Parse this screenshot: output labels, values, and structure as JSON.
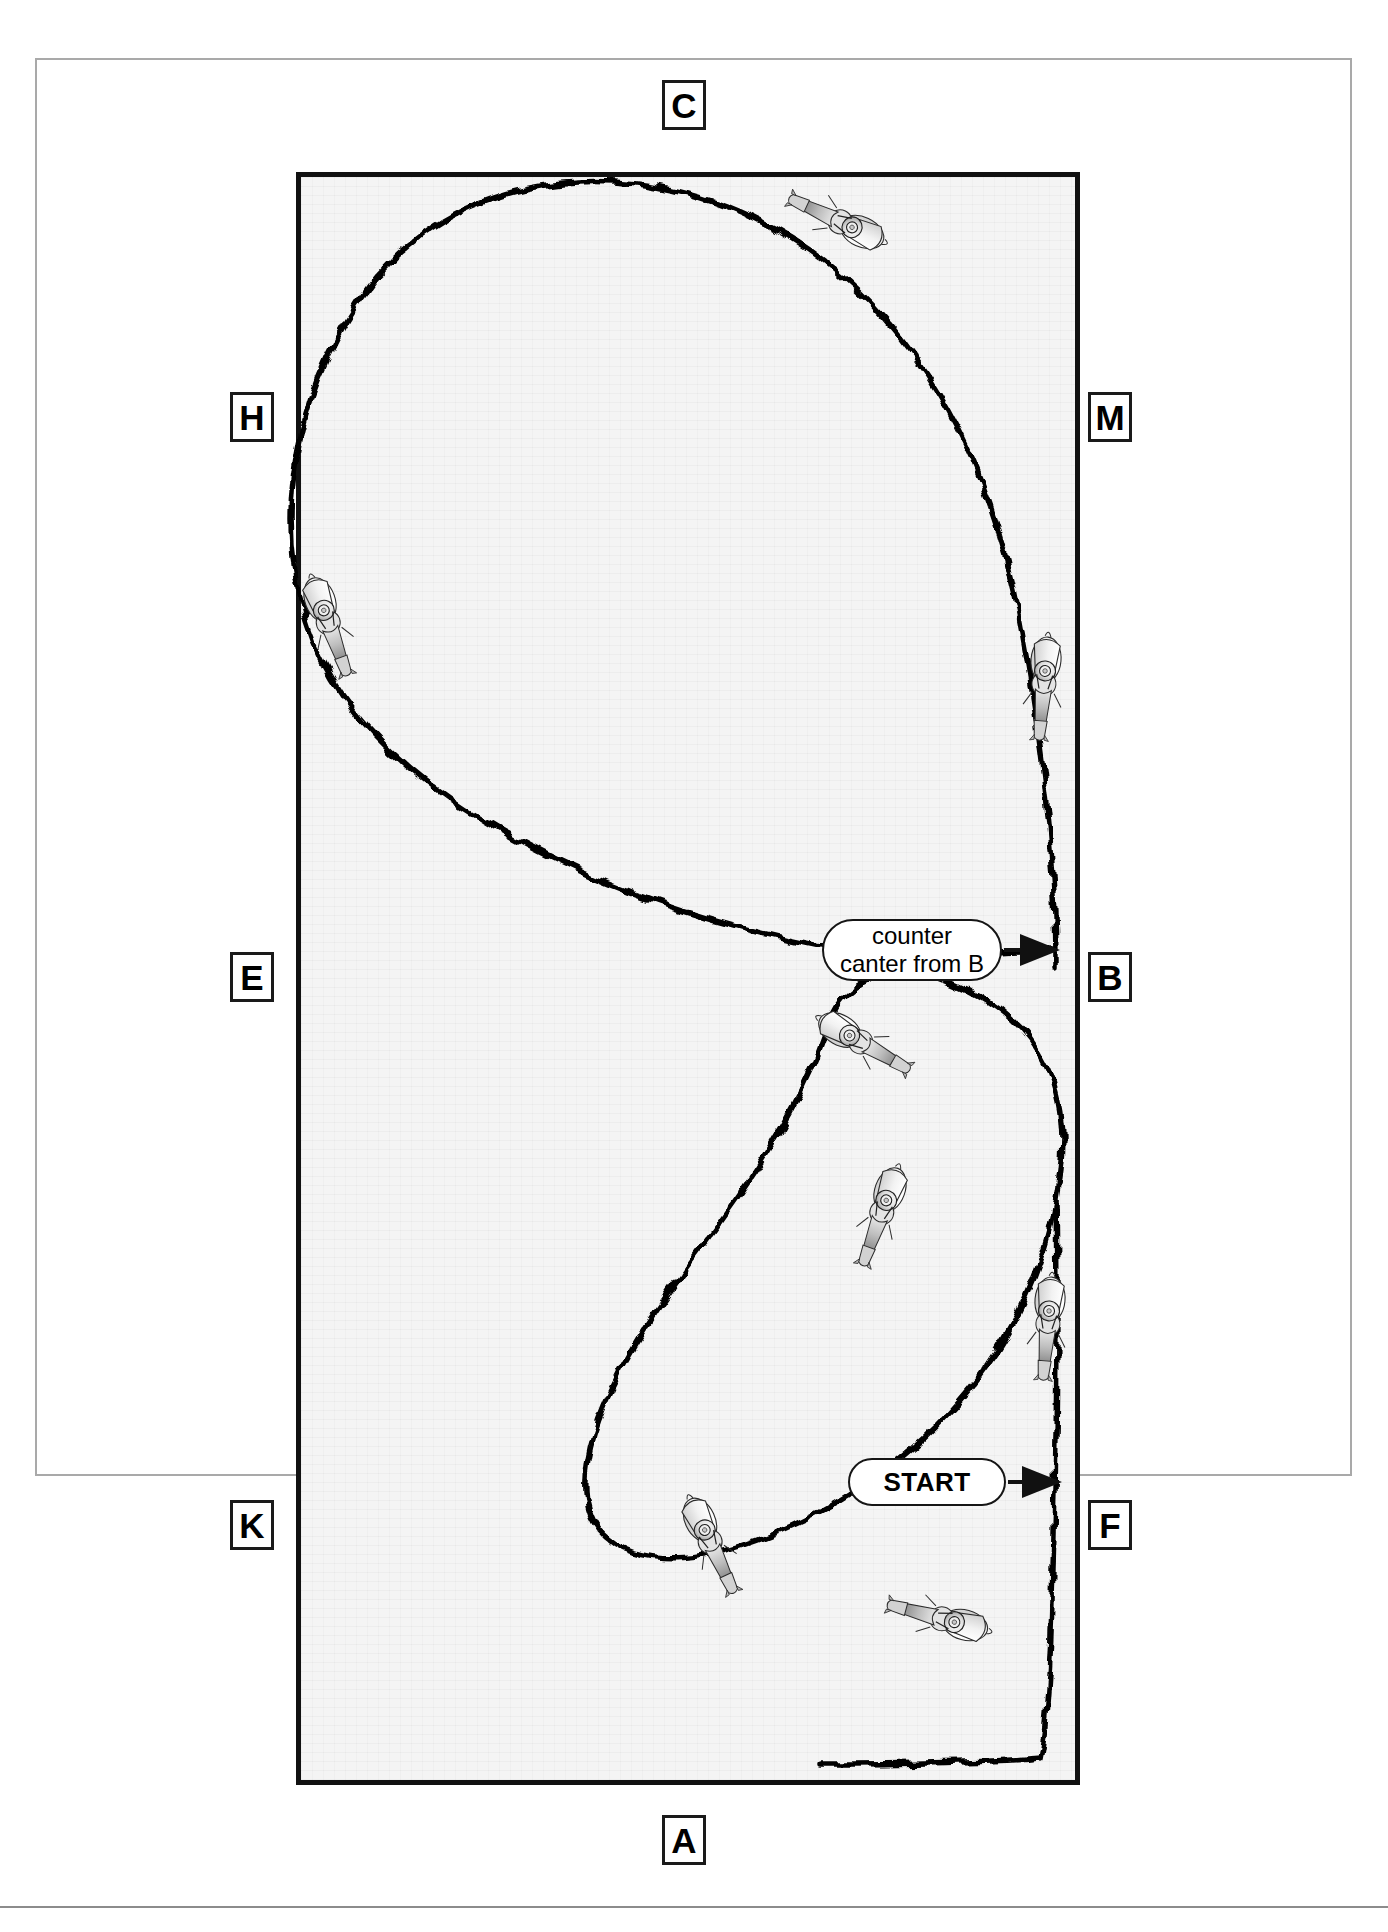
{
  "arena": {
    "markers": [
      {
        "id": "C",
        "label": "C",
        "position": "top-center",
        "x": 662,
        "y": 80
      },
      {
        "id": "H",
        "label": "H",
        "position": "left-upper",
        "x": 230,
        "y": 392
      },
      {
        "id": "M",
        "label": "M",
        "position": "right-upper",
        "x": 1088,
        "y": 392
      },
      {
        "id": "E",
        "label": "E",
        "position": "left-middle",
        "x": 230,
        "y": 952
      },
      {
        "id": "B",
        "label": "B",
        "position": "right-middle",
        "x": 1088,
        "y": 952
      },
      {
        "id": "K",
        "label": "K",
        "position": "left-lower",
        "x": 230,
        "y": 1500
      },
      {
        "id": "F",
        "label": "F",
        "position": "right-lower",
        "x": 1088,
        "y": 1500
      },
      {
        "id": "A",
        "label": "A",
        "position": "bottom-center",
        "x": 662,
        "y": 1815
      }
    ]
  },
  "callouts": [
    {
      "id": "counter-canter",
      "text": "counter\ncanter from B",
      "arrow": "right"
    },
    {
      "id": "start",
      "text": "START",
      "arrow": "right"
    }
  ],
  "riders": {
    "count": 8,
    "label": "horse-and-rider-top-view"
  },
  "colors": {
    "arena_border": "#111111",
    "arena_fill": "#f4f4f4",
    "page_border": "#a9a9a9",
    "path": "#000000",
    "marker_text": "#000000"
  }
}
